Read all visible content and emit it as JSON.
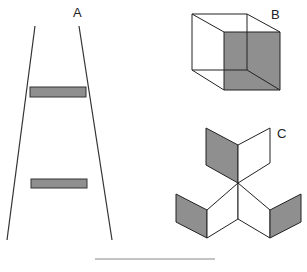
{
  "figure": {
    "labels": {
      "a": "A",
      "b": "B",
      "c": "C"
    },
    "colors": {
      "stroke": "#333333",
      "shade": "#8f8f8f",
      "background": "#ffffff",
      "rule": "#888888"
    },
    "panels": [
      {
        "id": "A",
        "description": "Ponzo illusion: two converging lines with two equal gray bars"
      },
      {
        "id": "B",
        "description": "Necker cube wireframe with one shaded face"
      },
      {
        "id": "C",
        "description": "Ambiguous three-part figure of rhombi with shaded faces"
      }
    ]
  },
  "caption": {
    "text": ""
  }
}
